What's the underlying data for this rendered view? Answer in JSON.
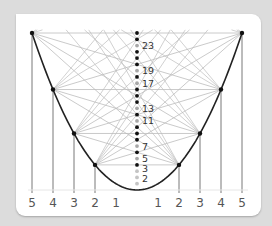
{
  "diagram": {
    "type": "parabola-sieve",
    "axis_labels_left": [
      "5",
      "4",
      "3",
      "2",
      "1"
    ],
    "axis_labels_right": [
      "1",
      "2",
      "3",
      "4",
      "5"
    ],
    "axis_values": [
      -5,
      -4,
      -3,
      -2,
      -1,
      1,
      2,
      3,
      4,
      5
    ],
    "node_points_x": [
      -5,
      -4,
      -3,
      -2,
      2,
      3,
      4,
      5
    ],
    "y_axis_dots": [
      1,
      2,
      3,
      4,
      5,
      6,
      7,
      8,
      9,
      10,
      11,
      12,
      13,
      14,
      15,
      16,
      17,
      18,
      19,
      20,
      21,
      22,
      23,
      24,
      25
    ],
    "prime_labels": [
      "2",
      "3",
      "5",
      "7",
      "11",
      "13",
      "17",
      "19",
      "23"
    ],
    "primes": [
      2,
      3,
      5,
      7,
      11,
      13,
      17,
      19,
      23
    ],
    "colors": {
      "background": "#dcdcdc",
      "card": "#ffffff",
      "parabola": "#222222",
      "sieve_lines": "#bdbdbd",
      "drop_lines": "#555555",
      "composite_dot": "#111111",
      "prime_dot": "#a8a8a8",
      "label": "#555555"
    }
  }
}
